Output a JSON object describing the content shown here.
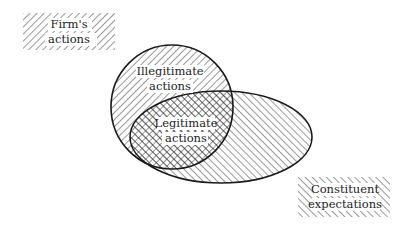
{
  "legend": {
    "firms_actions": [
      "Firm's",
      "actions"
    ],
    "constituent_expectations": [
      "Constituent",
      "expectations"
    ]
  },
  "regions": {
    "illegitimate": [
      "Illegitimate",
      "actions"
    ],
    "legitimate": [
      "Legitimate",
      "actions"
    ]
  },
  "colors": {
    "stroke": "#1a1a1a",
    "hatch": "#333333",
    "background": "#ffffff"
  }
}
